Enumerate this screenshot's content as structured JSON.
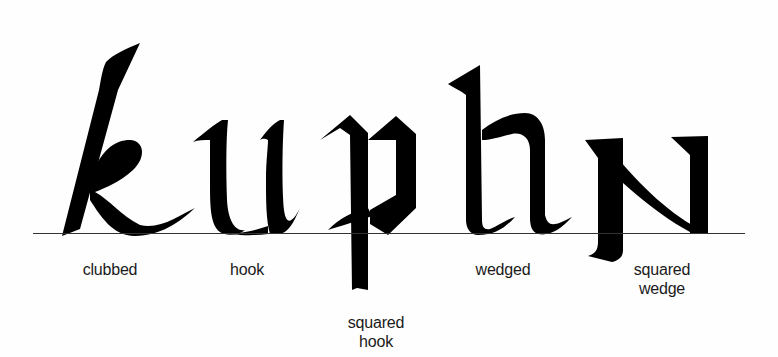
{
  "diagram": {
    "word": "kuphn",
    "colors": {
      "ink": "#000000",
      "baseline": "#333333",
      "label": "#1a1a1a",
      "background": "#fefefe"
    },
    "items": [
      {
        "letter": "k",
        "label": "clubbed"
      },
      {
        "letter": "u",
        "label": "hook"
      },
      {
        "letter": "p",
        "label": "squared hook"
      },
      {
        "letter": "h",
        "label": "wedged"
      },
      {
        "letter": "n",
        "label": "squared wedge"
      }
    ],
    "labels": {
      "clubbed": "clubbed",
      "hook": "hook",
      "squared_hook_line1": "squared",
      "squared_hook_line2": "hook",
      "wedged": "wedged",
      "squared_wedge_line1": "squared",
      "squared_wedge_line2": "wedge"
    }
  }
}
